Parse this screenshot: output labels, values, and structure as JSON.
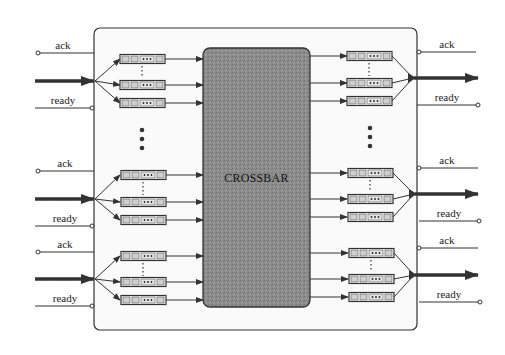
{
  "diagram": {
    "type": "crossbar-switch-block-diagram",
    "center_block": {
      "label": "CROSSBAR"
    },
    "signal_labels": {
      "ack": "ack",
      "ready": "ready"
    },
    "queue_ellipsis": "•••",
    "colors": {
      "line": "#333333",
      "crossbar_fill": "#8a8a8a",
      "queue_cell": "#cfcfcf",
      "outer_box": "#fafafa"
    },
    "left_ports": [
      {
        "ack": "ack",
        "ready": "ready"
      },
      {
        "ack": "ack",
        "ready": "ready"
      },
      {
        "ack": "ack",
        "ready": "ready"
      }
    ],
    "right_ports": [
      {
        "ack": "ack",
        "ready": "ready"
      },
      {
        "ack": "ack",
        "ready": "ready"
      },
      {
        "ack": "ack",
        "ready": "ready"
      }
    ]
  }
}
